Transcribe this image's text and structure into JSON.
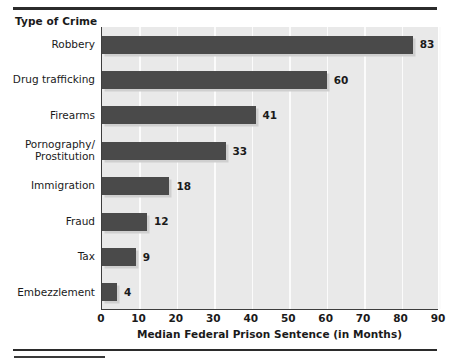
{
  "chart_data": {
    "type": "bar",
    "orientation": "horizontal",
    "title": "",
    "xlabel": "Median Federal Prison Sentence (in Months)",
    "ylabel": "Type of Crime",
    "categories": [
      "Robbery",
      "Drug trafficking",
      "Firearms",
      "Pornography/\nProstitution",
      "Immigration",
      "Fraud",
      "Tax",
      "Embezzlement"
    ],
    "values": [
      83,
      60,
      41,
      33,
      18,
      12,
      9,
      4
    ],
    "value_labels": [
      "83",
      "60",
      "41",
      "33",
      "18",
      "12",
      "9",
      "4"
    ],
    "xlim": [
      0,
      90
    ],
    "xticks": [
      0,
      10,
      20,
      30,
      40,
      50,
      60,
      70,
      80,
      90
    ],
    "xtick_labels": [
      "0",
      "10",
      "20",
      "30",
      "40",
      "50",
      "60",
      "70",
      "80",
      "90"
    ],
    "grid": "vertical",
    "legend": null,
    "bar_color": "#4a4a4a",
    "plot_background": "#e9e9e9",
    "gridline_color": "#fbfbfb",
    "shadow_color": "#cfcfcf",
    "axis_color": "#3d3d3d",
    "rule_color": "#2b2b2b"
  }
}
